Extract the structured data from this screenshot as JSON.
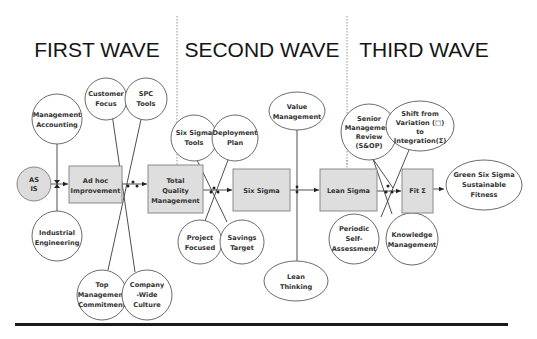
{
  "waves": [
    {
      "label": "FIRST WAVE"
    },
    {
      "label": "SECOND WAVE"
    },
    {
      "label": "THIRD WAVE"
    }
  ],
  "stages": {
    "as_is": [
      "AS",
      "IS"
    ],
    "ad_hoc": [
      "Ad hoc",
      "Improvement"
    ],
    "tqm": [
      "Total",
      "Quality",
      "Management"
    ],
    "six_sigma": [
      "Six Sigma"
    ],
    "lean_sigma": [
      "Lean Sigma"
    ],
    "fit_sigma": [
      "Fit Σ"
    ],
    "outcome": [
      "Green Six Sigma",
      "Sustainable",
      "Fitness"
    ]
  },
  "influences": {
    "management_accounting": [
      "Management",
      "Accounting"
    ],
    "industrial_engineering": [
      "Industrial",
      "Engineering"
    ],
    "customer_focus": [
      "Customer",
      "Focus"
    ],
    "spc_tools": [
      "SPC",
      "Tools"
    ],
    "top_management_commitment": [
      "Top",
      "Management",
      "Commitment"
    ],
    "company_wide_culture": [
      "Company",
      "-Wide",
      "Culture"
    ],
    "six_sigma_tools": [
      "Six Sigma",
      "Tools"
    ],
    "deployment_plan": [
      "Deployment",
      "Plan"
    ],
    "project_focused": [
      "Project",
      "Focused"
    ],
    "savings_target": [
      "Savings",
      "Target"
    ],
    "value_management": [
      "Value",
      "Management"
    ],
    "lean_thinking": [
      "Lean",
      "Thinking"
    ],
    "senior_management_review": [
      "Senior",
      "Management",
      "Review",
      "(S&OP)"
    ],
    "shift_from_variation": [
      "Shift from",
      "Variation (□)",
      "to",
      "Integration(Σ)"
    ],
    "periodic_self_assessment": [
      "Periodic",
      "Self-",
      "Assessment"
    ],
    "knowledge_management": [
      "Knowledge",
      "Management"
    ]
  }
}
